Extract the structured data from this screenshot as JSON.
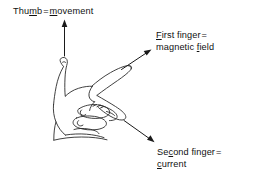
{
  "figure": {
    "background_color": "#ffffff",
    "ink_color": "#1a1a1a",
    "width": 254,
    "height": 177
  },
  "labels": {
    "thumb": {
      "part1_pre": "Thu",
      "part1_underlined": "m",
      "part1_post": "b",
      "equals": "=",
      "part2_underlined": "m",
      "part2_post": "ovement",
      "full_text": "Thumb = movement"
    },
    "first_finger": {
      "line1_underlined": "F",
      "line1_post": "irst finger",
      "equals": "=",
      "line2_pre": "magnetic ",
      "line2_underlined": "f",
      "line2_post": "ield",
      "full_text": "First finger = magnetic field"
    },
    "second_finger": {
      "line1_pre": "Se",
      "line1_underlined": "c",
      "line1_post": "ond finger",
      "equals": "=",
      "line2_underlined": "c",
      "line2_post": "urrent",
      "full_text": "Second finger = current"
    }
  },
  "arrows": [
    {
      "name": "arrow-to-thumb-label",
      "direction": "up",
      "from": "thumb tip",
      "to": "Thumb = movement"
    },
    {
      "name": "arrow-to-first-finger-label",
      "direction": "up-right",
      "from": "index finger tip",
      "to": "First finger = magnetic field"
    },
    {
      "name": "arrow-to-second-finger-label",
      "direction": "down-right",
      "from": "second finger",
      "to": "Second finger = current"
    }
  ],
  "hand": {
    "description": "left hand with thumb up, first finger forward, second finger bent",
    "parts": [
      "thumb",
      "first-finger",
      "second-finger",
      "curled-fingers",
      "palm",
      "wrist"
    ]
  }
}
